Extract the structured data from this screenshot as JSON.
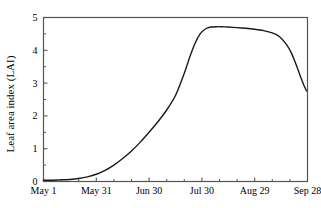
{
  "chart_data": {
    "type": "line",
    "title": "",
    "xlabel": "",
    "ylabel": "Leaf area index (LAI)",
    "xlim": [
      0,
      150
    ],
    "ylim": [
      0,
      5
    ],
    "grid": false,
    "legend": "none",
    "x_unit": "days since May 1",
    "x_tick_labels": [
      "May 1",
      "May 31",
      "Jun 30",
      "Jul 30",
      "Aug 29",
      "Sep 28"
    ],
    "x_tick_values": [
      0,
      30,
      60,
      90,
      120,
      150
    ],
    "x_minor_tick_interval": 10,
    "y_tick_labels": [
      "0",
      "1",
      "2",
      "3",
      "4",
      "5"
    ],
    "y_tick_values": [
      0,
      1,
      2,
      3,
      4,
      5
    ],
    "y_minor_tick_interval": 0.5,
    "series": [
      {
        "name": "Leaf area index",
        "color": "#1a1a1a",
        "line_width": 1.4,
        "x": [
          0,
          5,
          10,
          15,
          20,
          25,
          30,
          35,
          40,
          45,
          50,
          55,
          60,
          65,
          70,
          75,
          80,
          83,
          86,
          89,
          92,
          95,
          98,
          101,
          105,
          110,
          115,
          120,
          125,
          130,
          134,
          138,
          141,
          144,
          146,
          148,
          149.5
        ],
        "values": [
          0.04,
          0.04,
          0.05,
          0.06,
          0.09,
          0.14,
          0.22,
          0.34,
          0.5,
          0.7,
          0.93,
          1.2,
          1.5,
          1.82,
          2.18,
          2.62,
          3.3,
          3.78,
          4.2,
          4.5,
          4.65,
          4.71,
          4.72,
          4.72,
          4.71,
          4.69,
          4.67,
          4.64,
          4.6,
          4.53,
          4.42,
          4.18,
          3.9,
          3.5,
          3.2,
          2.93,
          2.76
        ]
      }
    ]
  },
  "axes": {
    "y_axis_title": "Leaf area index (LAI)"
  },
  "colors": {
    "line": "#1a1a1a",
    "frame": "#555555",
    "background": "#ffffff",
    "text": "#000000"
  }
}
